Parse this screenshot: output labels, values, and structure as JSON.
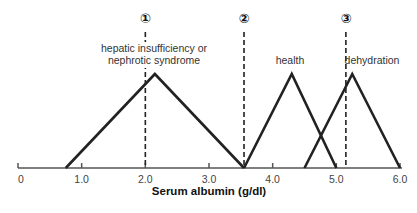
{
  "chart_data": {
    "type": "line",
    "title": "",
    "xlabel": "Serum albumin (g/dl)",
    "ylabel": "",
    "xlim": [
      0,
      6.0
    ],
    "x_ticks": [
      "0",
      "1.0",
      "2.0",
      "3.0",
      "4.0",
      "5.0",
      "6.0"
    ],
    "grid": false,
    "series": [
      {
        "name": "hepatic insufficiency or nephrotic syndrome",
        "label_lines": [
          "hepatic insufficiency or",
          "nephrotic syndrome"
        ],
        "x": [
          0.75,
          2.15,
          3.55
        ],
        "y": [
          0,
          1,
          0
        ]
      },
      {
        "name": "health",
        "label_lines": [
          "health"
        ],
        "x": [
          3.55,
          4.3,
          5.0
        ],
        "y": [
          0,
          1,
          0
        ]
      },
      {
        "name": "dehydration",
        "label_lines": [
          "dehydration"
        ],
        "x": [
          4.5,
          5.25,
          6.0
        ],
        "y": [
          0,
          1,
          0
        ]
      }
    ],
    "thresholds": [
      {
        "marker": "①",
        "x": 2.0
      },
      {
        "marker": "②",
        "x": 3.55
      },
      {
        "marker": "③",
        "x": 5.15
      }
    ]
  }
}
